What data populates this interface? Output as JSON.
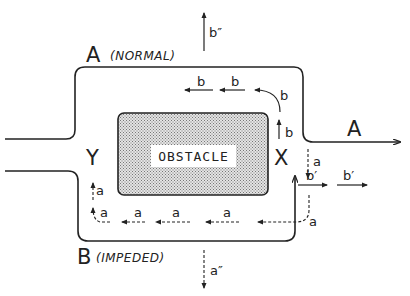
{
  "diagram": {
    "labels": {
      "route_a": "A",
      "route_a_note": "(NORMAL)",
      "route_b": "B",
      "route_b_note": "(IMPEDED)",
      "exit_a": "A",
      "point_x": "X",
      "point_y": "Y",
      "obstacle": "OBSTACLE"
    },
    "flow_labels": {
      "b_top_1": "b",
      "b_top_2": "b",
      "b_curve": "b",
      "b_up": "b",
      "b_escape": "b″",
      "b_prime_1": "b′",
      "b_prime_2": "b′",
      "a_down": "a",
      "a_curve": "a",
      "a_bottom_1": "a",
      "a_bottom_2": "a",
      "a_bottom_3": "a",
      "a_left_curve": "a",
      "a_left_up": "a",
      "a_escape": "a″"
    },
    "colors": {
      "line": "#222222",
      "obstacle_fill": "#c8c8c8",
      "obstacle_label_bg": "#ffffff"
    }
  }
}
